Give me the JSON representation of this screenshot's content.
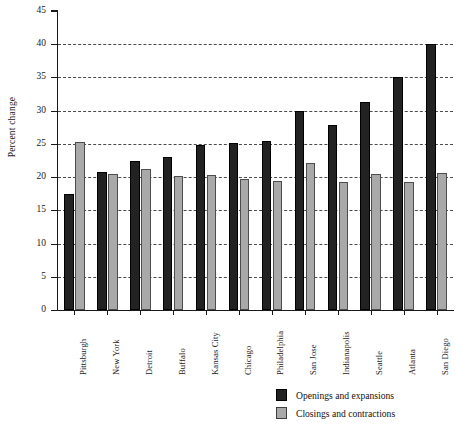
{
  "chart_data": {
    "type": "bar",
    "title": "",
    "xlabel": "",
    "ylabel": "Percent change",
    "ylim": [
      0,
      45
    ],
    "ytick_step": 5,
    "yticks": [
      0,
      5,
      10,
      15,
      20,
      25,
      30,
      35,
      40,
      45
    ],
    "grid": "horizontal-dashed",
    "legend_position": "bottom-center",
    "categories": [
      "Pittsburgh",
      "New York",
      "Detroit",
      "Buffalo",
      "Kansas City",
      "Chicago",
      "Philadelphia",
      "San Jose",
      "Indianapolis",
      "Seattle",
      "Atlanta",
      "San Diego"
    ],
    "series": [
      {
        "name": "Openings and expansions",
        "color": "#222222",
        "values": [
          17.5,
          20.8,
          22.5,
          23.0,
          24.8,
          25.2,
          25.4,
          29.9,
          27.8,
          31.3,
          35.0,
          40.0
        ]
      },
      {
        "name": "Closings and contractions",
        "color": "#a9a9a9",
        "values": [
          25.3,
          20.4,
          21.2,
          20.1,
          20.3,
          19.7,
          19.4,
          22.1,
          19.2,
          20.4,
          19.3,
          20.6
        ]
      }
    ]
  },
  "legend": {
    "items": [
      {
        "label": "Openings and expansions",
        "swatch": "dark"
      },
      {
        "label": "Closings and contractions",
        "swatch": "light"
      }
    ]
  }
}
